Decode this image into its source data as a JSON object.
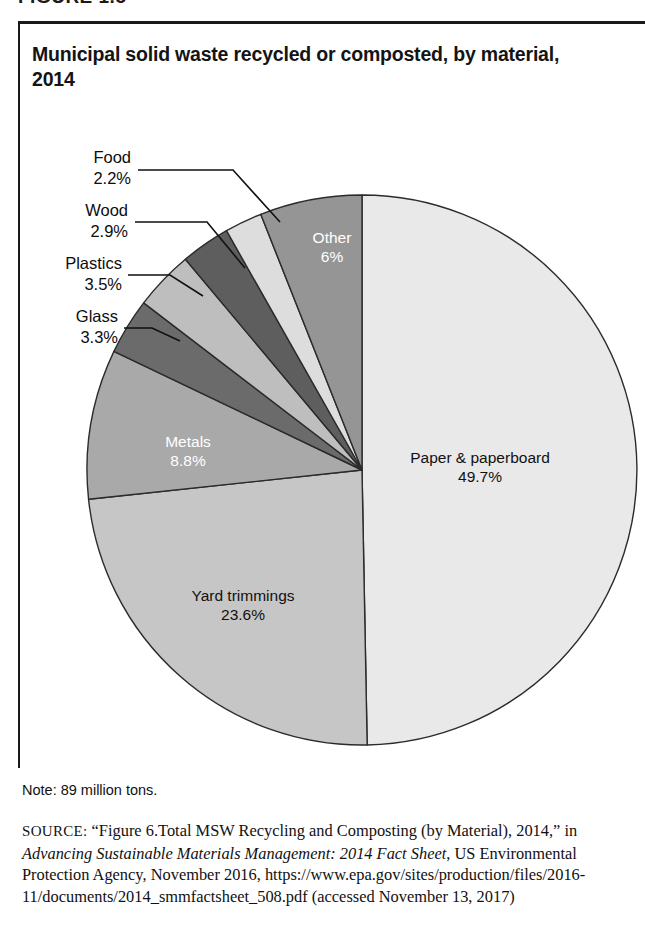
{
  "figure": {
    "number_label": "FIGURE 1.5"
  },
  "chart_title": "Municipal solid waste recycled or composted, by material, 2014",
  "note": "Note: 89 million tons.",
  "source": {
    "label": "SOURCE:",
    "part1": " “Figure 6.Total MSW Recycling and Composting (by Material), 2014,” in ",
    "italic1": "Advancing Sustainable Materials Management: 2014 Fact Sheet",
    "part2": ", US Environmental Protection Agency, November 2016, https://www.epa.gov/sites/production/files/2016-11/documents/2014_smmfactsheet_508.pdf (accessed November 13, 2017)"
  },
  "chart_data": {
    "type": "pie",
    "title": "Municipal solid waste recycled or composted, by material, 2014",
    "unit": "percent of total",
    "total_note": "89 million tons",
    "start_angle_deg": 0,
    "direction": "clockwise",
    "legend": "none (labels on/around slices)",
    "categories": [
      "Paper & paperboard",
      "Yard trimmings",
      "Metals",
      "Glass",
      "Plastics",
      "Wood",
      "Food",
      "Other"
    ],
    "values": [
      49.7,
      23.6,
      8.8,
      3.3,
      3.5,
      2.9,
      2.2,
      6.0
    ],
    "value_labels": [
      "49.7%",
      "23.6%",
      "8.8%",
      "3.3%",
      "3.5%",
      "2.9%",
      "2.2%",
      "6%"
    ],
    "colors": [
      "#e9e9e9",
      "#c6c6c6",
      "#a9a9a9",
      "#6b6b6b",
      "#bebebe",
      "#5e5e5e",
      "#dddddd",
      "#959595"
    ],
    "slices": [
      {
        "name": "Paper & paperboard",
        "value": 49.7,
        "label": "Paper & paperboard",
        "value_label": "49.7%",
        "color": "#e9e9e9",
        "label_placement": "inside",
        "label_color": "#111111"
      },
      {
        "name": "Yard trimmings",
        "value": 23.6,
        "label": "Yard trimmings",
        "value_label": "23.6%",
        "color": "#c6c6c6",
        "label_placement": "inside",
        "label_color": "#111111"
      },
      {
        "name": "Metals",
        "value": 8.8,
        "label": "Metals",
        "value_label": "8.8%",
        "color": "#a9a9a9",
        "label_placement": "inside",
        "label_color": "#ffffff"
      },
      {
        "name": "Glass",
        "value": 3.3,
        "label": "Glass",
        "value_label": "3.3%",
        "color": "#6b6b6b",
        "label_placement": "callout",
        "label_color": "#111111"
      },
      {
        "name": "Plastics",
        "value": 3.5,
        "label": "Plastics",
        "value_label": "3.5%",
        "color": "#bebebe",
        "label_placement": "callout",
        "label_color": "#111111"
      },
      {
        "name": "Wood",
        "value": 2.9,
        "label": "Wood",
        "value_label": "2.9%",
        "color": "#5e5e5e",
        "label_placement": "callout",
        "label_color": "#111111"
      },
      {
        "name": "Food",
        "value": 2.2,
        "label": "Food",
        "value_label": "2.2%",
        "color": "#dddddd",
        "label_placement": "callout",
        "label_color": "#111111"
      },
      {
        "name": "Other",
        "value": 6.0,
        "label": "Other",
        "value_label": "6%",
        "color": "#959595",
        "label_placement": "inside",
        "label_color": "#ffffff"
      }
    ]
  }
}
